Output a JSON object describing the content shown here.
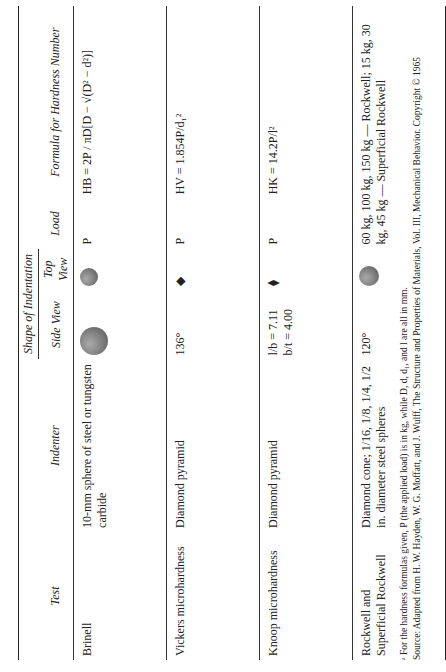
{
  "header": {
    "group": "Shape of Indentation",
    "cols": [
      "Test",
      "Indenter",
      "Side View",
      "Top View",
      "Load",
      "Formula for Hardness Number"
    ]
  },
  "rows": [
    {
      "test": "Brinell",
      "indenter": "10-mm sphere of steel or tungsten carbide",
      "load": "P",
      "formula": "HB = 2P / πD[D − √(D² − d²)]"
    },
    {
      "test": "Vickers microhardness",
      "indenter": "Diamond pyramid",
      "side_angle": "136°",
      "load": "P",
      "formula": "HV = 1.854P/d₁²"
    },
    {
      "test": "Knoop microhardness",
      "indenter": "Diamond pyramid",
      "side_note": "l/b = 7.11  b/t = 4.00",
      "load": "P",
      "formula": "HK = 14.2P/l²"
    },
    {
      "test": "Rockwell and Superficial Rockwell",
      "indenter": "Diamond cone; 1/16, 1/8, 1/4, 1/2 in. diameter steel spheres",
      "side_angle": "120°",
      "load": "60 kg, 100 kg, 150 kg — Rockwell; 15 kg, 30 kg, 45 kg — Superficial Rockwell",
      "formula": ""
    }
  ],
  "footnote": "ᵃ For the hardness formulas given, P (the applied load) is in kg, while D, d, d₁, and l are all in mm.",
  "source": "Source: Adapted from H. W. Hayden, W. G. Moffatt, and J. Wulff, The Structure and Properties of Materials, Vol. III, Mechanical Behavior. Copyright © 1965"
}
